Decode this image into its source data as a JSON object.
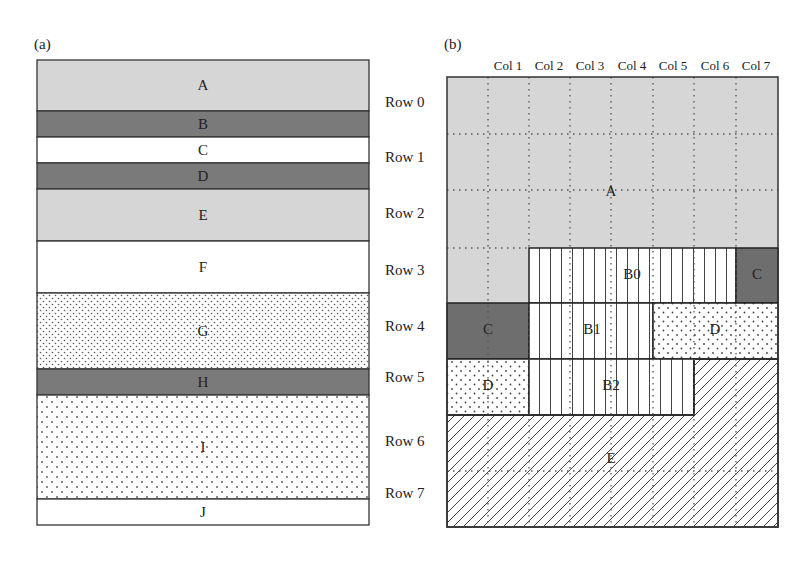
{
  "panels": {
    "a": {
      "label": "(a)",
      "bands": [
        {
          "name": "A",
          "top": 60,
          "height": 51,
          "fill": "light-gray"
        },
        {
          "name": "B",
          "top": 111,
          "height": 26,
          "fill": "dark-gray"
        },
        {
          "name": "C",
          "top": 137,
          "height": 26,
          "fill": "white"
        },
        {
          "name": "D",
          "top": 163,
          "height": 26,
          "fill": "dark-gray"
        },
        {
          "name": "E",
          "top": 189,
          "height": 52,
          "fill": "light-gray"
        },
        {
          "name": "F",
          "top": 241,
          "height": 52,
          "fill": "white"
        },
        {
          "name": "G",
          "top": 293,
          "height": 76,
          "fill": "fine-dots"
        },
        {
          "name": "H",
          "top": 369,
          "height": 26,
          "fill": "dark-gray"
        },
        {
          "name": "I",
          "top": 395,
          "height": 104,
          "fill": "sparse-dots"
        },
        {
          "name": "J",
          "top": 499,
          "height": 26,
          "fill": "white"
        }
      ]
    },
    "b": {
      "label": "(b)",
      "columns": [
        "Col 1",
        "Col 2",
        "Col 3",
        "Col 4",
        "Col 5",
        "Col 6",
        "Col 7"
      ],
      "regions": [
        {
          "name": "A",
          "label": "A",
          "fill": "light-gray"
        },
        {
          "name": "B0",
          "label": "B0",
          "fill": "vertical-lines"
        },
        {
          "name": "C-row3",
          "label": "C",
          "fill": "dark-gray"
        },
        {
          "name": "C-row4",
          "label": "C",
          "fill": "dark-gray"
        },
        {
          "name": "B1",
          "label": "B1",
          "fill": "vertical-lines"
        },
        {
          "name": "D-row4",
          "label": "D",
          "fill": "dots"
        },
        {
          "name": "D-row5",
          "label": "D",
          "fill": "dots"
        },
        {
          "name": "B2",
          "label": "B2",
          "fill": "vertical-lines"
        },
        {
          "name": "E",
          "label": "E",
          "fill": "diagonal-hatch"
        }
      ]
    }
  },
  "rows": [
    "Row 0",
    "Row 1",
    "Row 2",
    "Row 3",
    "Row 4",
    "Row 5",
    "Row 6",
    "Row 7"
  ],
  "colors": {
    "light_gray": "#d6d6d6",
    "dark_gray": "#7a7a7a",
    "border": "#333333",
    "white": "#ffffff"
  }
}
